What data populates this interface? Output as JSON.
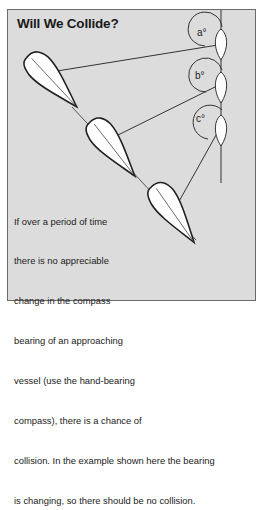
{
  "title": "Will We Collide?",
  "labels": {
    "a": "a°",
    "b": "b°",
    "c": "c°"
  },
  "caption_lines": [
    "If over a period of time",
    "there is no appreciable",
    "change in the compass",
    "bearing of an approaching",
    "vessel (use the hand-bearing",
    "compass), there is a chance of",
    "collision. In the example shown here the bearing",
    "is changing, so there should be no collision."
  ],
  "colors": {
    "background": "#dcdcdc",
    "hull_fill": "#ffffff",
    "line": "#333333"
  }
}
